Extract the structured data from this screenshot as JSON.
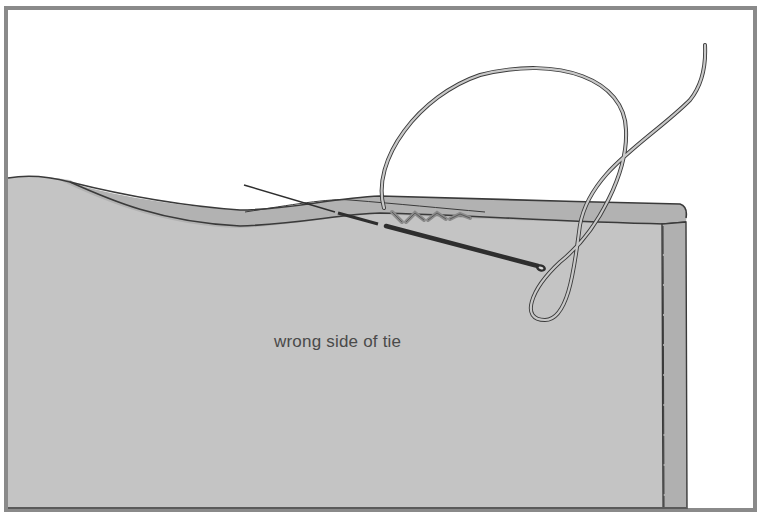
{
  "figure": {
    "type": "sewing-illustration",
    "label": "wrong side of tie",
    "colors": {
      "background": "#ffffff",
      "frame": "#8a8a8a",
      "fabric": "#c4c4c4",
      "fold": "#b2b2b2",
      "outline": "#3a3a3a",
      "needle": "#2e2e2e",
      "thread": "#9a9a9a",
      "text": "#4a4a4a"
    },
    "elements": [
      "frame",
      "tie-fabric",
      "folded-edge",
      "right-hem",
      "needle",
      "thread",
      "stitches",
      "label"
    ]
  }
}
